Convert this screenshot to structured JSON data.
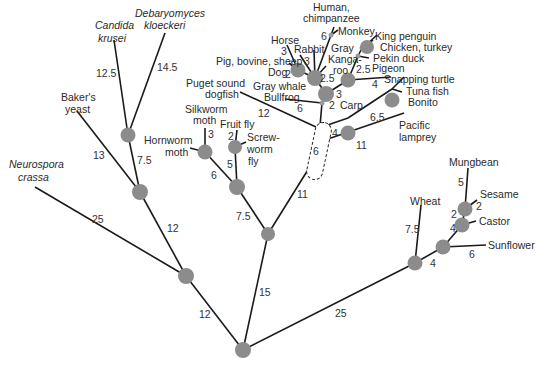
{
  "diagram": {
    "type": "phylogenetic-tree",
    "colors": {
      "edge": "#1a1a1a",
      "node": "#8c8c8c",
      "background": "#ffffff"
    },
    "species": {
      "neurospora_l1": "Neurospora",
      "neurospora_l2": "crassa",
      "bakers_l1": "Baker's",
      "bakers_l2": "yeast",
      "candida_l1": "Candida",
      "candida_l2": "krusei",
      "debaryomyces_l1": "Debaryomyces",
      "debaryomyces_l2": "kloeckeri",
      "silkworm_l1": "Silkworm",
      "silkworm_l2": "moth",
      "hornworm_l1": "Hornworm",
      "hornworm_l2": "moth",
      "fruitfly": "Fruit fly",
      "screwworm_l1": "Screw-",
      "screwworm_l2": "worm",
      "screwworm_l3": "fly",
      "puget_l1": "Puget sound",
      "puget_l2": "dogfish",
      "graywhale": "Gray whale",
      "bullfrog": "Bullfrog",
      "pig": "Pig, bovine, sheep",
      "dog": "Dog",
      "horse": "Horse",
      "rabbit": "Rabbit",
      "human_l1": "Human,",
      "human_l2": "chimpanzee",
      "monkey": "Monkey",
      "kangaroo_l1": "Gray",
      "kangaroo_l2": "Kanga-",
      "kangaroo_l3": "roo",
      "kingpenguin": "King penguin",
      "chicken": "Chicken, turkey",
      "pekinduck": "Pekin duck",
      "pigeon": "Pigeon",
      "turtle": "Snapping turtle",
      "tuna": "Tuna fish",
      "bonito": "Bonito",
      "carp": "Carp",
      "lamprey_l1": "Pacific",
      "lamprey_l2": "lamprey",
      "mungbean": "Mungbean",
      "sesame": "Sesame",
      "castor": "Castor",
      "wheat": "Wheat",
      "sunflower": "Sunflower"
    },
    "branch_lengths": {
      "root_fungi": "12",
      "root_animals": "15",
      "root_plants": "25",
      "neurospora": "25",
      "fungi_yeasts": "12",
      "bakers": "13",
      "yeasts_cd": "7.5",
      "candida": "12.5",
      "debaryomyces": "14.5",
      "animals_insects": "7.5",
      "animals_vertebrates": "11",
      "insects_moths": "6",
      "insects_flies": "5",
      "silkworm": "3",
      "fruitfly": "2",
      "puget": "12",
      "lamprey": "11",
      "vert_internal": "6",
      "carp": "4",
      "tuna": "6.5",
      "bullfrog": "6",
      "tetrapod": "2",
      "amniote": "3",
      "mammals": "2.5",
      "dog": "2",
      "horse": "3",
      "rabbit": "3",
      "human": "6",
      "birds": "2.5",
      "turtle": "4",
      "wheat": "7.5",
      "plants_sunflower": "4",
      "sunflower": "6",
      "castor": "4",
      "sesame_castor": "2",
      "mungbean": "5",
      "sesame": "2"
    }
  }
}
